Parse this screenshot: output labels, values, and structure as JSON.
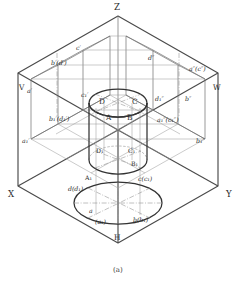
{
  "figure": {
    "caption": "(a)",
    "colors": {
      "outline": "#3c3c3c",
      "plane_edge": "#555555",
      "thin_line": "#8a8a8a",
      "cylinder": "#2e2e2e",
      "text": "#2b2b2b"
    }
  },
  "axes": [
    {
      "name": "z-axis-label",
      "text": "Z"
    },
    {
      "name": "x-axis-label",
      "text": "X"
    },
    {
      "name": "y-axis-label",
      "text": "Y"
    }
  ],
  "planes": [
    {
      "name": "v-plane-label",
      "text": "V"
    },
    {
      "name": "w-plane-label",
      "text": "W"
    },
    {
      "name": "h-plane-label",
      "text": "H"
    }
  ],
  "solid_points": [
    {
      "name": "point-A",
      "text": "A"
    },
    {
      "name": "point-B",
      "text": "B"
    },
    {
      "name": "point-C",
      "text": "C"
    },
    {
      "name": "point-D",
      "text": "D"
    },
    {
      "name": "point-A1",
      "text": "A₁"
    },
    {
      "name": "point-B1",
      "text": "B₁"
    },
    {
      "name": "point-C1",
      "text": "C₁"
    },
    {
      "name": "point-D1",
      "text": "D₁"
    }
  ],
  "v_projections": [
    {
      "name": "label-a-prime",
      "text": "a′"
    },
    {
      "name": "label-b-prime-d-prime",
      "text": "b′(d′)"
    },
    {
      "name": "label-c-prime",
      "text": "c′"
    },
    {
      "name": "label-a1-prime",
      "text": "a₁′"
    },
    {
      "name": "label-b1-prime-d1-prime",
      "text": "b₁′(d₁′)"
    },
    {
      "name": "label-c1-prime",
      "text": "c₁′"
    }
  ],
  "w_projections": [
    {
      "name": "label-a-dprime-c-dprime",
      "text": "a″(c″)"
    },
    {
      "name": "label-b-dprime",
      "text": "b″"
    },
    {
      "name": "label-d-dprime",
      "text": "d″"
    },
    {
      "name": "label-a1-dprime-c1-dprime",
      "text": "a₁″(c₁″)"
    },
    {
      "name": "label-b1-dprime",
      "text": "b₁″"
    },
    {
      "name": "label-d1-dprime",
      "text": "d₁″"
    }
  ],
  "h_projections": [
    {
      "name": "label-a",
      "text": "a"
    },
    {
      "name": "label-a1-paren",
      "text": "(a₁)"
    },
    {
      "name": "label-b-b1",
      "text": "b(b₁)"
    },
    {
      "name": "label-c-c1",
      "text": "c(c₁)"
    },
    {
      "name": "label-d-d1",
      "text": "d(d₁)"
    }
  ]
}
